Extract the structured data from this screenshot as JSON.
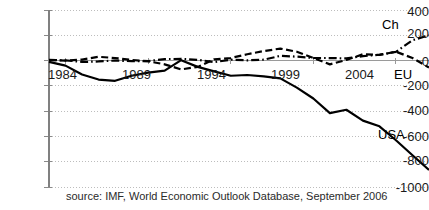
{
  "chart_data": {
    "type": "line",
    "title": "",
    "subtitle": "",
    "xlabel": "",
    "ylabel": "",
    "xlim": [
      1983,
      2006
    ],
    "ylim": [
      -1000,
      400
    ],
    "grid": true,
    "grid_style": "dotted-horizontal",
    "legend_position": "inline-right-labels",
    "source_note": "source: IMF, World Economic Outlook Database, September 2006",
    "y_ticks": [
      400,
      200,
      0,
      -200,
      -400,
      -600,
      -800,
      -1000
    ],
    "y_tick_labels": [
      "400",
      "200",
      "0",
      "-200",
      "-400",
      "-600",
      "-800",
      "-1000"
    ],
    "x_ticks": [
      1984,
      1989,
      1994,
      1999,
      2004
    ],
    "x_tick_labels": [
      "1984",
      "1989",
      "1994",
      "1999",
      "2004"
    ],
    "x": [
      1983,
      1984,
      1985,
      1986,
      1987,
      1988,
      1989,
      1990,
      1991,
      1992,
      1993,
      1994,
      1995,
      1996,
      1997,
      1998,
      1999,
      2000,
      2001,
      2002,
      2003,
      2004,
      2005,
      2006
    ],
    "series": [
      {
        "name": "USA",
        "label": "USA",
        "line_style": "solid",
        "color": "#000000",
        "width": 2.2,
        "values": [
          -10,
          -40,
          -110,
          -150,
          -160,
          -120,
          -95,
          -80,
          3,
          -50,
          -85,
          -120,
          -114,
          -125,
          -141,
          -214,
          -300,
          -416,
          -389,
          -475,
          -520,
          -630,
          -749,
          -865
        ]
      },
      {
        "name": "EU",
        "label": "EU",
        "line_style": "dashed",
        "color": "#000000",
        "width": 2.2,
        "values": [
          5,
          0,
          8,
          30,
          20,
          5,
          -5,
          -30,
          -70,
          -50,
          10,
          20,
          50,
          75,
          95,
          70,
          20,
          -30,
          5,
          50,
          45,
          70,
          20,
          -55
        ]
      },
      {
        "name": "Ch",
        "label": "Ch",
        "line_style": "dashdot",
        "color": "#000000",
        "width": 2.2,
        "values": [
          4,
          2,
          -11,
          -7,
          0,
          -4,
          -4,
          12,
          13,
          6,
          -12,
          7,
          2,
          7,
          37,
          31,
          21,
          20,
          17,
          35,
          46,
          69,
          161,
          200
        ]
      }
    ],
    "axis_color": "#808080",
    "grid_color": "#bdbdbd",
    "text_color": "#1a1a1a"
  }
}
